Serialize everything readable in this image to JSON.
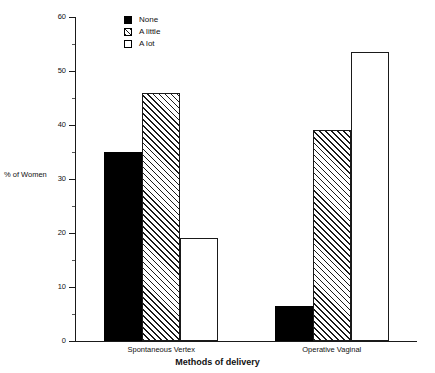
{
  "chart_data": {
    "type": "bar",
    "title": "",
    "xlabel": "Methods of delivery",
    "ylabel": "% of Women",
    "categories": [
      "Spontaneous Vertex",
      "Operative Vaginal"
    ],
    "series": [
      {
        "name": "None",
        "fill": "solid",
        "values": [
          35,
          6.5
        ]
      },
      {
        "name": "A little",
        "fill": "hatch",
        "values": [
          46,
          39
        ]
      },
      {
        "name": "A lot",
        "fill": "open",
        "values": [
          19,
          53.5
        ]
      }
    ],
    "ylim": [
      0,
      60
    ],
    "y_major_ticks": [
      0,
      10,
      20,
      30,
      40,
      50,
      60
    ],
    "y_minor_ticks": [
      5,
      15,
      25,
      35,
      45,
      55
    ],
    "y_tick_labels": [
      "0",
      "10",
      "20",
      "30",
      "40",
      "50",
      "60"
    ],
    "grid": false,
    "legend_position": "top-left-inside",
    "colors": {
      "ink": "#1a1a1a",
      "solid": "#000000",
      "open": "#ffffff",
      "background": "#ffffff"
    }
  }
}
